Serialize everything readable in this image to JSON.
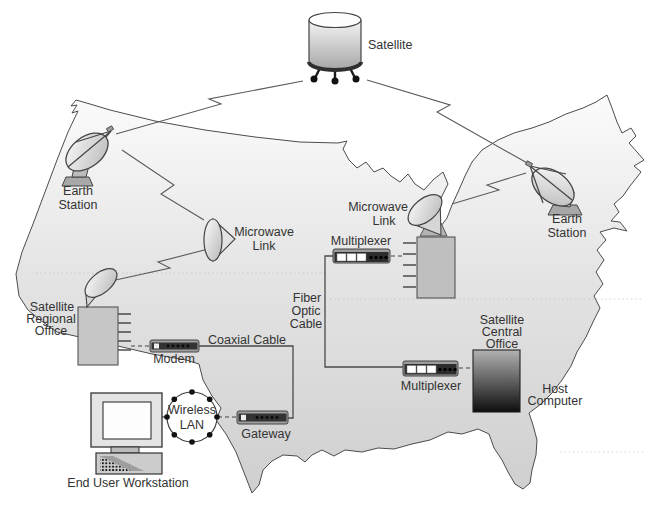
{
  "diagram": {
    "kind": "satellite-wan-network-topology-over-us-map",
    "nodes": {
      "satellite": {
        "label": "Satellite",
        "icon": "satellite-cylinder-icon"
      },
      "earth_station_west": {
        "label_lines": [
          "Earth",
          "Station"
        ],
        "icon": "satellite-dish-icon"
      },
      "earth_station_east": {
        "label_lines": [
          "Earth",
          "Station"
        ],
        "icon": "satellite-dish-icon"
      },
      "microwave_link_west": {
        "label_lines": [
          "Microwave",
          "Link"
        ],
        "icon": "microwave-horn-icon"
      },
      "microwave_link_east": {
        "label_lines": [
          "Microwave",
          "Link"
        ],
        "icon": "microwave-dish-icon"
      },
      "multiplexer_north": {
        "label": "Multiplexer",
        "icon": "multiplexer-device-icon"
      },
      "multiplexer_south": {
        "label": "Multiplexer",
        "icon": "multiplexer-device-icon"
      },
      "satellite_regional_office": {
        "label_lines": [
          "Satellite",
          "Regional",
          "Office"
        ],
        "icon": "office-box-icon"
      },
      "satellite_central_office": {
        "label_lines": [
          "Satellite",
          "Central",
          "Office"
        ],
        "icon": "office-box-icon"
      },
      "host_computer": {
        "label_lines": [
          "Host",
          "Computer"
        ],
        "icon": "mainframe-box-icon"
      },
      "modem": {
        "label": "Modem",
        "icon": "modem-device-icon"
      },
      "gateway": {
        "label": "Gateway",
        "icon": "gateway-device-icon"
      },
      "wireless_lan": {
        "label_lines": [
          "Wireless",
          "LAN"
        ],
        "icon": "wireless-ring-icon"
      },
      "end_user_workstation": {
        "label": "End User Workstation",
        "icon": "desktop-computer-icon"
      }
    },
    "links": {
      "coaxial_cable": {
        "label": "Coaxial Cable",
        "style": "solid-right-angle"
      },
      "fiber_optic_cable": {
        "label_lines": [
          "Fiber",
          "Optic",
          "Cable"
        ],
        "style": "solid-right-angle"
      },
      "wireless_zigzag_links": {
        "style": "lightning-zigzag",
        "count": 5
      }
    },
    "colors": {
      "background": "#ffffff",
      "map_fill_top": "#fbfbfb",
      "map_fill_bottom": "#cfcfcf",
      "map_outline": "#4c4c4c",
      "device_dark": "#2d2d2d",
      "device_light": "#9c9c9c",
      "box_fill": "#c5c5c5",
      "host_gradient_top": "#b2b2b2",
      "host_gradient_bottom": "#0e0e0e",
      "text": "#333333",
      "line": "#5a5a5a"
    }
  }
}
